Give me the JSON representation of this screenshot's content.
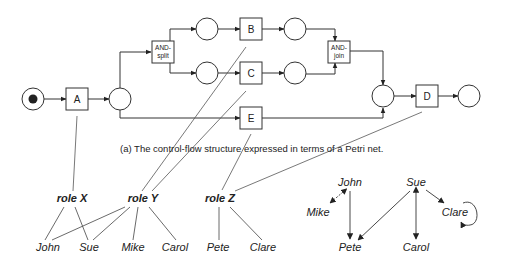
{
  "caption": "(a) The control-flow structure expressed in terms of a Petri net.",
  "petri_net": {
    "transitions": {
      "A": "A",
      "and_split_1": "AND-",
      "and_split_2": "split",
      "B": "B",
      "C": "C",
      "E": "E",
      "and_join_1": "AND-",
      "and_join_2": "join",
      "D": "D"
    },
    "places": [
      "start",
      "p1",
      "p2",
      "p3",
      "p4",
      "p5",
      "p6",
      "end"
    ],
    "initial_token": "start"
  },
  "roles": {
    "X": "role X",
    "Y": "role Y",
    "Z": "role Z"
  },
  "role_assignments": [
    {
      "task": "A",
      "role": "role X"
    },
    {
      "task": "B",
      "role": "role Y"
    },
    {
      "task": "C",
      "role": "role Y"
    },
    {
      "task": "E",
      "role": "role Z"
    },
    {
      "task": "D",
      "role": "role Z"
    }
  ],
  "people": {
    "john": "John",
    "sue": "Sue",
    "mike": "Mike",
    "carol": "Carol",
    "pete": "Pete",
    "clare": "Clare"
  },
  "role_members": {
    "role X": [
      "John",
      "Sue"
    ],
    "role Y": [
      "John",
      "Sue",
      "Mike",
      "Carol"
    ],
    "role Z": [
      "Pete",
      "Clare"
    ]
  },
  "social_network": {
    "nodes": {
      "john": "John",
      "mike": "Mike",
      "pete": "Pete",
      "sue": "Sue",
      "carol": "Carol",
      "clare": "Clare"
    },
    "edges": [
      {
        "from": "John",
        "to": "Mike",
        "type": "bidirectional"
      },
      {
        "from": "John",
        "to": "Pete",
        "type": "directed"
      },
      {
        "from": "Sue",
        "to": "Pete",
        "type": "directed"
      },
      {
        "from": "Sue",
        "to": "Carol",
        "type": "bidirectional"
      },
      {
        "from": "Sue",
        "to": "Clare",
        "type": "directed"
      },
      {
        "from": "Clare",
        "to": "Clare",
        "type": "self-loop"
      }
    ]
  }
}
